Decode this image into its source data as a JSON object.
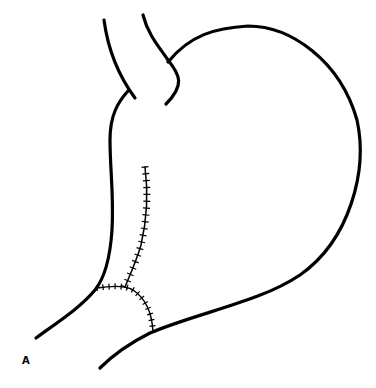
{
  "figure": {
    "panel_label": "A",
    "colors": {
      "stroke": "#000000",
      "background": "#ffffff"
    }
  }
}
